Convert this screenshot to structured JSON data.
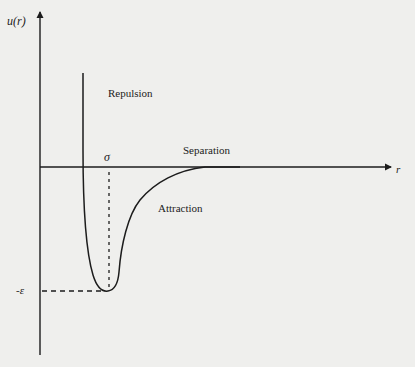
{
  "figure": {
    "title": "",
    "y_axis_label": "u(r)",
    "x_axis_label": "r",
    "sigma_label": "σ",
    "epsilon_label": "-ε",
    "regions": {
      "repulsion": "Repulsion",
      "separation": "Separation",
      "attraction": "Attraction"
    },
    "colors": {
      "background": "#efefed",
      "ink": "#1c1c1c"
    },
    "curve": {
      "type": "Lennard-Jones-like potential well",
      "description": "Steep repulsive wall descending to a minimum at depth -ε, then rising asymptotically to zero with separation",
      "features": {
        "zero_crossing": "σ",
        "minimum_value": "-ε"
      }
    }
  }
}
